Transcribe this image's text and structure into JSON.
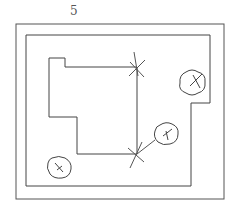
{
  "figure": {
    "label": "5",
    "type": "site plan",
    "elements": {
      "property_boundary": "outer rectangle",
      "setback_line": "inner stepped boundary",
      "building": "stepped building footprint",
      "trees": [
        {
          "name": "tree-top-right"
        },
        {
          "name": "tree-middle-right"
        },
        {
          "name": "tree-bottom-left"
        }
      ],
      "markers": [
        {
          "name": "survey-mark-top"
        },
        {
          "name": "survey-mark-bottom"
        }
      ]
    },
    "stroke_color": "#444444"
  }
}
